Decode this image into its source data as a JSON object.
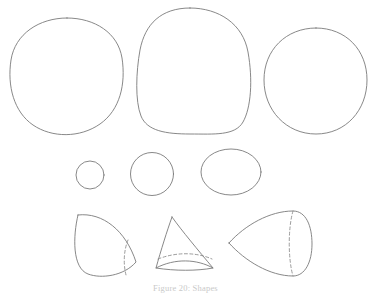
{
  "figure": {
    "caption": "Figure 20: Shapes",
    "background_color": "#ffffff",
    "stroke_color": "#7a7a7a",
    "hidden_edge_color": "#8a8a8a",
    "width": 371,
    "height": 292,
    "rows": [
      {
        "row_name": "large-blobs-row",
        "shapes": [
          {
            "name": "rounded-square-blob",
            "label": "rounded square blob"
          },
          {
            "name": "tall-egg-blob",
            "label": "tall egg blob"
          },
          {
            "name": "near-circle-blob",
            "label": "near circle blob"
          }
        ]
      },
      {
        "row_name": "small-circles-row",
        "shapes": [
          {
            "name": "small-circle",
            "label": "small circle"
          },
          {
            "name": "medium-circle",
            "label": "medium circle"
          },
          {
            "name": "wide-ellipse",
            "label": "wide ellipse"
          }
        ]
      },
      {
        "row_name": "solids-row",
        "shapes": [
          {
            "name": "lens-solid",
            "label": "lens solid with hidden edge"
          },
          {
            "name": "cone-dome-solid",
            "label": "pointed dome solid with hidden base"
          },
          {
            "name": "teardrop-solid",
            "label": "teardrop solid with hidden seam"
          }
        ]
      }
    ]
  }
}
